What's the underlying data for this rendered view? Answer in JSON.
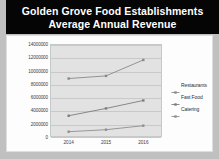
{
  "title": {
    "line1": "Golden Grove Food Establishments",
    "line2": "Average Annual Revenue"
  },
  "colors": {
    "banner_background": "#050505",
    "banner_text": "#ffffff",
    "page_background": "#c0c0c0",
    "chart_background": "#fdfdfd",
    "plot_background": "#e2e2e2",
    "gridline": "#c9c9c9",
    "series_restaurants": "#8a8a8a",
    "series_fast_food": "#7d7d7d",
    "series_catering": "#8f8f8f"
  },
  "legend": {
    "position": "right",
    "items": [
      {
        "label": "Restaurants",
        "marker": "line-marker-icon"
      },
      {
        "label": "Fast Food",
        "marker": "line-marker-icon"
      },
      {
        "label": "Catering",
        "marker": "line-marker-icon"
      }
    ]
  },
  "chart_data": {
    "type": "line",
    "title": "Golden Grove Food Establishments Average Annual Revenue",
    "xlabel": "",
    "ylabel": "",
    "categories": [
      "2014",
      "2015",
      "2016"
    ],
    "series": [
      {
        "name": "Restaurants",
        "values": [
          8800000,
          9200000,
          11600000
        ]
      },
      {
        "name": "Fast Food",
        "values": [
          3200000,
          4300000,
          5500000
        ]
      },
      {
        "name": "Catering",
        "values": [
          800000,
          1100000,
          1700000
        ]
      }
    ],
    "ylim": [
      0,
      14000000
    ],
    "ytick_labels": [
      "14000000",
      "12000000",
      "10000000",
      "8000000",
      "6000000",
      "4000000",
      "2000000",
      "0"
    ],
    "ytick_values": [
      14000000,
      12000000,
      10000000,
      8000000,
      6000000,
      4000000,
      2000000,
      0
    ],
    "xtick_labels": [
      "2014",
      "2015",
      "2016"
    ],
    "grid": true,
    "legend_position": "right"
  }
}
